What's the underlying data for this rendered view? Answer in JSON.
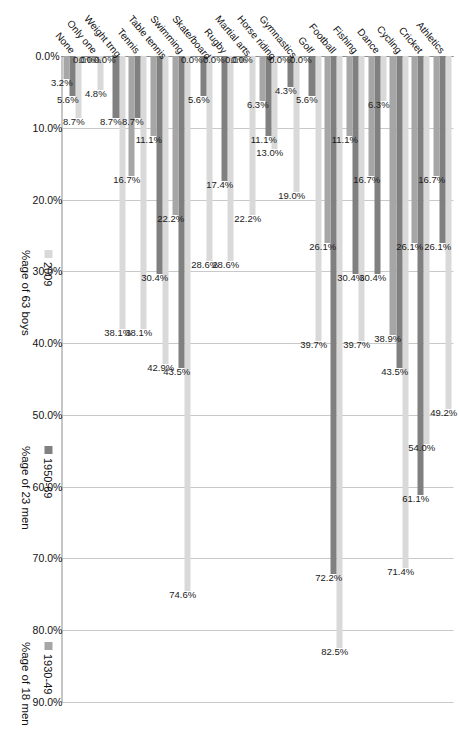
{
  "chart_data": {
    "type": "bar",
    "orientation": "horizontal",
    "rotated_degrees": 90,
    "title": "",
    "xlabel": "",
    "ylabel": "",
    "xlim": [
      0,
      90
    ],
    "axis_ticks": [
      "0.0%",
      "10.0%",
      "20.0%",
      "30.0%",
      "40.0%",
      "50.0%",
      "60.0%",
      "70.0%",
      "80.0%",
      "90.0%"
    ],
    "axis_tick_values": [
      0,
      10,
      20,
      30,
      40,
      50,
      60,
      70,
      80,
      90
    ],
    "grid": true,
    "legend_position": "right",
    "categories": [
      "Athletics",
      "Cricket",
      "Cycling",
      "Dance",
      "Fishing",
      "Football",
      "Golf",
      "Gymnastics",
      "Horse riding",
      "Martial arts",
      "Rugby",
      "Skate/board",
      "Swimming",
      "Table tennis",
      "Tennis",
      "Weight trng",
      "Only one",
      "None"
    ],
    "series": [
      {
        "name": "2009",
        "sublabel": "%age of 63 boys",
        "color": "#d9d9d9",
        "values": [
          49.2,
          54.0,
          71.4,
          6.3,
          39.7,
          82.5,
          39.7,
          19.0,
          13.0,
          22.2,
          28.6,
          28.6,
          74.6,
          42.9,
          38.1,
          38.1,
          4.8,
          8.7
        ],
        "labels": [
          "49.2%",
          "54.0%",
          "71.4%",
          "6.3%",
          "39.7%",
          "82.5%",
          "39.7%",
          "19.0%",
          "13.0%",
          "22.2%",
          "28.6%",
          "28.6%",
          "74.6%",
          "42.9%",
          "38.1%",
          "38.1%",
          "4.8%",
          "8.7%"
        ]
      },
      {
        "name": "1950-69",
        "sublabel": "%age of 23 men",
        "color": "#808080",
        "values": [
          26.1,
          61.1,
          43.5,
          30.4,
          30.4,
          72.2,
          5.6,
          4.3,
          11.1,
          0.0,
          17.4,
          5.6,
          43.5,
          30.4,
          8.7,
          8.7,
          0.0,
          5.6
        ],
        "labels": [
          "26.1%",
          "61.1%",
          "43.5%",
          "30.4%",
          "30.4%",
          "72.2%",
          "5.6%",
          "4.3%",
          "11.1%",
          "0.0%",
          "17.4%",
          "5.6%",
          "43.5%",
          "30.4%",
          "8.7%",
          "8.7%",
          "0.0%",
          "5.6%"
        ]
      },
      {
        "name": "1930-49",
        "sublabel": "%age of 18 men",
        "color": "#a6a6a6",
        "values": [
          16.7,
          26.1,
          38.9,
          16.7,
          11.1,
          26.1,
          0.0,
          0.0,
          6.3,
          0.0,
          0.0,
          0.0,
          22.2,
          11.1,
          16.7,
          0.0,
          0.0,
          3.2
        ],
        "labels": [
          "16.7%",
          "26.1%",
          "38.9%",
          "16.7%",
          "11.1%",
          "26.1%",
          "0.0%",
          "0.0%",
          "6.3%",
          "0.0%",
          "0.0%",
          "0.0%",
          "22.2%",
          "11.1%",
          "16.7%",
          "0.0%",
          "0.0%",
          "3.2%"
        ]
      }
    ]
  }
}
